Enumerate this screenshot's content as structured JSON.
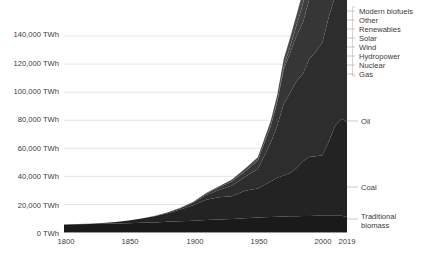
{
  "chart_data": {
    "type": "area",
    "title": "",
    "subtitle": "",
    "xlabel": "",
    "ylabel": "",
    "stacked": true,
    "grid": true,
    "legend_position": "right",
    "xlim": [
      1800,
      2019
    ],
    "ylim": [
      0,
      160000
    ],
    "y_unit": "TWh",
    "y_ticks": [
      0,
      20000,
      40000,
      60000,
      80000,
      100000,
      120000,
      140000
    ],
    "y_tick_labels": [
      "0 TWh",
      "20,000 TWh",
      "40,000 TWh",
      "60,000 TWh",
      "80,000 TWh",
      "100,000 TWh",
      "120,000 TWh",
      "140,000 TWh"
    ],
    "x_ticks": [
      1800,
      1850,
      1900,
      1950,
      2000,
      2019
    ],
    "x_tick_labels": [
      "1800",
      "1850",
      "1900",
      "1950",
      "2000",
      "2019"
    ],
    "x": [
      1800,
      1810,
      1820,
      1830,
      1840,
      1850,
      1860,
      1870,
      1880,
      1890,
      1900,
      1910,
      1920,
      1930,
      1940,
      1950,
      1960,
      1965,
      1970,
      1975,
      1980,
      1985,
      1990,
      1995,
      2000,
      2005,
      2010,
      2015,
      2019
    ],
    "series": [
      {
        "name": "Traditional biomass",
        "color": "#1a1a1a",
        "inline_label": "Traditional biomass",
        "values": [
          5600,
          5800,
          6000,
          6200,
          6400,
          6600,
          6900,
          7200,
          7600,
          8000,
          8400,
          8900,
          9300,
          9700,
          10200,
          10700,
          11100,
          11300,
          11400,
          11500,
          11600,
          11700,
          11800,
          11850,
          11900,
          11950,
          11980,
          12000,
          11111
        ]
      },
      {
        "name": "Coal",
        "color": "#232323",
        "inline_label": "Coal",
        "values": [
          97,
          180,
          320,
          580,
          1100,
          1900,
          3000,
          4400,
          6200,
          8400,
          11000,
          14500,
          15800,
          16100,
          19500,
          20600,
          25300,
          27800,
          29200,
          30900,
          34300,
          39100,
          42200,
          42500,
          43200,
          53000,
          64500,
          69000,
          67600
        ]
      },
      {
        "name": "Oil",
        "color": "#2d2d2d",
        "inline_label": "Oil",
        "values": [
          0,
          0,
          0,
          0,
          0,
          0,
          20,
          150,
          400,
          900,
          1800,
          3300,
          5200,
          7700,
          9800,
          14000,
          27500,
          37000,
          51000,
          57000,
          62000,
          62500,
          70000,
          74500,
          80500,
          89000,
          92500,
          98000,
          101000
        ]
      },
      {
        "name": "Gas",
        "color": "#363636",
        "values": [
          0,
          0,
          0,
          0,
          0,
          0,
          0,
          20,
          80,
          200,
          500,
          1000,
          1900,
          2900,
          4000,
          6000,
          12000,
          16800,
          24500,
          28500,
          32500,
          36500,
          43000,
          46500,
          52500,
          59500,
          66500,
          72500,
          79000
        ]
      },
      {
        "name": "Nuclear",
        "color": "#3f3f3f",
        "values": [
          0,
          0,
          0,
          0,
          0,
          0,
          0,
          0,
          0,
          0,
          0,
          0,
          0,
          0,
          0,
          0,
          200,
          700,
          2000,
          4500,
          7500,
          13500,
          17500,
          19500,
          21500,
          22500,
          22000,
          21500,
          23000
        ]
      },
      {
        "name": "Hydropower",
        "color": "#4a4a4a",
        "values": [
          0,
          0,
          0,
          0,
          0,
          0,
          0,
          0,
          20,
          80,
          200,
          450,
          800,
          1400,
          1900,
          2400,
          3600,
          4400,
          5400,
          6400,
          7300,
          8500,
          9500,
          10500,
          11500,
          12500,
          14500,
          16000,
          17000
        ]
      },
      {
        "name": "Wind",
        "color": "#555555",
        "values": [
          0,
          0,
          0,
          0,
          0,
          0,
          0,
          0,
          0,
          0,
          0,
          0,
          0,
          0,
          0,
          0,
          0,
          0,
          0,
          0,
          0,
          10,
          60,
          190,
          800,
          2000,
          5500,
          11000,
          15500
        ]
      },
      {
        "name": "Solar",
        "color": "#616161",
        "values": [
          0,
          0,
          0,
          0,
          0,
          0,
          0,
          0,
          0,
          0,
          0,
          0,
          0,
          0,
          0,
          0,
          0,
          0,
          0,
          0,
          0,
          0,
          5,
          15,
          50,
          150,
          800,
          4200,
          8500
        ]
      },
      {
        "name": "Renewables",
        "color": "#6d6d6d",
        "values": [
          0,
          0,
          0,
          0,
          0,
          0,
          0,
          0,
          0,
          0,
          0,
          0,
          0,
          0,
          0,
          0,
          10,
          30,
          80,
          150,
          300,
          500,
          900,
          1400,
          2000,
          2800,
          3800,
          5200,
          6500
        ]
      },
      {
        "name": "Other",
        "color": "#7a7a7a",
        "values": [
          0,
          0,
          0,
          0,
          0,
          0,
          0,
          0,
          0,
          0,
          0,
          0,
          0,
          0,
          0,
          0,
          0,
          0,
          0,
          0,
          0,
          0,
          0,
          0,
          0,
          0,
          0,
          0,
          0
        ]
      },
      {
        "name": "Modern biofuels",
        "color": "#888888",
        "values": [
          0,
          0,
          0,
          0,
          0,
          0,
          0,
          0,
          0,
          0,
          0,
          0,
          0,
          0,
          0,
          0,
          0,
          0,
          0,
          0,
          50,
          120,
          250,
          420,
          700,
          1400,
          2600,
          3800,
          4500
        ]
      }
    ],
    "legend": {
      "entries": [
        "Modern biofuels",
        "Other",
        "Renewables",
        "Solar",
        "Wind",
        "Hydropower",
        "Nuclear",
        "Gas"
      ]
    },
    "inline_annotations": [
      {
        "label": "Oil",
        "y_value": 108000
      },
      {
        "label": "Coal",
        "y_value": 42000
      },
      {
        "label": "Traditional biomass",
        "y_value": 6000
      }
    ]
  },
  "axis": {
    "y_labels": {
      "t0": "0 TWh",
      "t1": "20,000 TWh",
      "t2": "40,000 TWh",
      "t3": "60,000 TWh",
      "t4": "80,000 TWh",
      "t5": "100,000 TWh",
      "t6": "120,000 TWh",
      "t7": "140,000 TWh"
    },
    "x_labels": {
      "t0": "1800",
      "t1": "1850",
      "t2": "1900",
      "t3": "1950",
      "t4": "2000",
      "t5": "2019"
    }
  },
  "legend_labels": {
    "l0": "Modern biofuels",
    "l1": "Other",
    "l2": "Renewables",
    "l3": "Solar",
    "l4": "Wind",
    "l5": "Hydropower",
    "l6": "Nuclear",
    "l7": "Gas"
  },
  "inline_labels": {
    "oil": "Oil",
    "coal": "Coal",
    "biomass_line1": "Traditional",
    "biomass_line2": "biomass"
  },
  "colors": {
    "grid": "#d9d9d9",
    "axis": "#9a9a9a",
    "text": "#3a3a3a",
    "leader": "#b3b3b3"
  }
}
